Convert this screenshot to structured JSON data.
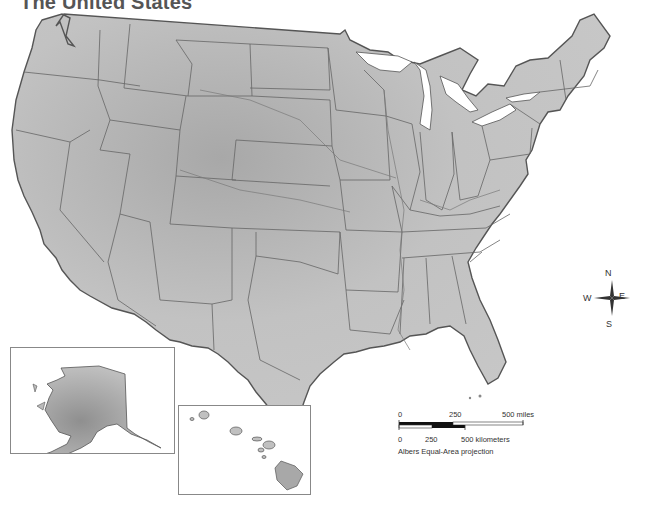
{
  "title": "The United States",
  "compass": {
    "n": "N",
    "s": "S",
    "e": "E",
    "w": "W"
  },
  "scale": {
    "miles": {
      "start": "0",
      "mid": "250",
      "end": "500 miles"
    },
    "km": {
      "start": "0",
      "mid": "250",
      "end": "500 kilometers"
    },
    "projection": "Albers Equal-Area projection"
  },
  "insets": [
    {
      "name": "Alaska"
    },
    {
      "name": "Hawaii"
    }
  ],
  "colors": {
    "land": "#bdbdbd",
    "land_dark": "#9a9a9a",
    "border": "#555555",
    "water": "#ffffff"
  }
}
